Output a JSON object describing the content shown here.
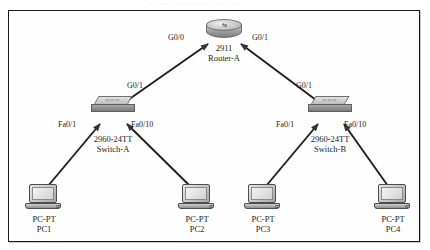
{
  "caption_fragment": "· · ·   · · · · ·    · · ·   · · · · · · ·",
  "frame": {
    "border_color": "#1a1a1a",
    "background": "#fefefe"
  },
  "diagram": {
    "type": "network-topology",
    "title": "",
    "devices": [
      {
        "id": "router-a",
        "icon": "router-icon",
        "model": "2911",
        "name": "Router-A",
        "x": 224,
        "y": 30
      },
      {
        "id": "switch-a",
        "icon": "switch-icon",
        "model": "2960-24TT",
        "name": "Switch-A",
        "x": 113,
        "y": 104
      },
      {
        "id": "switch-b",
        "icon": "switch-icon",
        "model": "2960-24TT",
        "name": "Switch-B",
        "x": 330,
        "y": 104
      },
      {
        "id": "pc1",
        "icon": "pc-icon",
        "model": "PC-PT",
        "name": "PC1",
        "x": 43,
        "y": 192
      },
      {
        "id": "pc2",
        "icon": "pc-icon",
        "model": "PC-PT",
        "name": "PC2",
        "x": 196,
        "y": 192
      },
      {
        "id": "pc3",
        "icon": "pc-icon",
        "model": "PC-PT",
        "name": "PC3",
        "x": 262,
        "y": 192
      },
      {
        "id": "pc4",
        "icon": "pc-icon",
        "model": "PC-PT",
        "name": "PC4",
        "x": 392,
        "y": 192
      }
    ],
    "links": [
      {
        "from": "switch-a",
        "to": "router-a",
        "from_port": "G0/1",
        "to_port": "G0/0"
      },
      {
        "from": "switch-b",
        "to": "router-a",
        "from_port": "G0/1",
        "to_port": "G0/1"
      },
      {
        "from": "pc1",
        "to": "switch-a",
        "to_port": "Fa0/1"
      },
      {
        "from": "pc2",
        "to": "switch-a",
        "to_port": "Fa0/10"
      },
      {
        "from": "pc3",
        "to": "switch-b",
        "to_port": "Fa0/1"
      },
      {
        "from": "pc4",
        "to": "switch-b",
        "to_port": "Fa0/10"
      }
    ],
    "interface_labels": {
      "router_left": "G0/0",
      "router_right": "G0/1",
      "switch_a_uplink": "G0/1",
      "switch_a_left": "Fa0/1",
      "switch_a_right": "Fa0/10",
      "switch_b_uplink": "G0/1",
      "switch_b_left": "Fa0/1",
      "switch_b_right": "Fa0/10"
    },
    "icon_glyphs": {
      "router_arrows": "↹",
      "switch_ports": "▭▭▭"
    }
  }
}
